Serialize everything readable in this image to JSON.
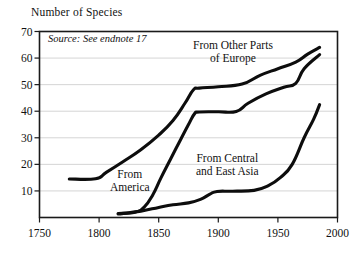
{
  "chart_data": {
    "type": "line",
    "title": "Number of Species",
    "xlabel": "",
    "ylabel": "Number of Species",
    "xlim": [
      1750,
      2000
    ],
    "ylim": [
      0,
      70
    ],
    "xticks": [
      1750,
      1800,
      1850,
      1900,
      1950,
      2000
    ],
    "yticks": [
      10,
      20,
      30,
      40,
      50,
      60,
      70
    ],
    "xtick_labels": [
      "1750",
      "1800",
      "1850",
      "1900",
      "1950",
      "2000"
    ],
    "ytick_labels": [
      "10",
      "20",
      "30",
      "40",
      "50",
      "60",
      "70"
    ],
    "grid": "horizontal",
    "legend_position": "inline-annotations",
    "annotations": [
      {
        "name": "source",
        "text": "Source: See endnote 17",
        "style": "italic"
      }
    ],
    "series": [
      {
        "name": "From America",
        "label_lines": [
          "From",
          "America"
        ],
        "points": [
          [
            1775,
            14.5
          ],
          [
            1797,
            14.6
          ],
          [
            1806,
            17.0
          ],
          [
            1820,
            21.0
          ],
          [
            1835,
            25.5
          ],
          [
            1850,
            31.0
          ],
          [
            1862,
            36.5
          ],
          [
            1872,
            43.0
          ],
          [
            1879,
            48.0
          ],
          [
            1884,
            48.7
          ],
          [
            1900,
            49.2
          ],
          [
            1920,
            50.2
          ],
          [
            1935,
            53.5
          ],
          [
            1950,
            56.0
          ],
          [
            1965,
            58.5
          ],
          [
            1975,
            61.5
          ],
          [
            1985,
            64.0
          ]
        ]
      },
      {
        "name": "From Other Parts of Europe",
        "label_lines": [
          "From Other Parts",
          "of Europe"
        ],
        "points": [
          [
            1816,
            1.5
          ],
          [
            1830,
            2.0
          ],
          [
            1838,
            4.0
          ],
          [
            1845,
            8.5
          ],
          [
            1852,
            15.0
          ],
          [
            1860,
            22.0
          ],
          [
            1868,
            29.0
          ],
          [
            1875,
            35.0
          ],
          [
            1880,
            39.0
          ],
          [
            1884,
            39.7
          ],
          [
            1900,
            39.8
          ],
          [
            1915,
            39.9
          ],
          [
            1925,
            43.0
          ],
          [
            1940,
            46.5
          ],
          [
            1955,
            49.0
          ],
          [
            1965,
            50.5
          ],
          [
            1972,
            56.0
          ],
          [
            1985,
            61.3
          ]
        ]
      },
      {
        "name": "From Central and East Asia",
        "label_lines": [
          "From Central",
          "and East Asia"
        ],
        "points": [
          [
            1816,
            1.3
          ],
          [
            1835,
            2.4
          ],
          [
            1850,
            3.8
          ],
          [
            1862,
            4.8
          ],
          [
            1875,
            5.5
          ],
          [
            1885,
            6.8
          ],
          [
            1893,
            8.8
          ],
          [
            1899,
            9.8
          ],
          [
            1912,
            9.9
          ],
          [
            1930,
            10.2
          ],
          [
            1942,
            12.0
          ],
          [
            1952,
            15.0
          ],
          [
            1962,
            20.0
          ],
          [
            1972,
            30.0
          ],
          [
            1980,
            37.0
          ],
          [
            1985,
            42.5
          ]
        ]
      }
    ],
    "colors": {
      "line": "#0d0d0d",
      "grid": "#c9c9c9",
      "frame": "#1a1a1a",
      "background": "#ffffff",
      "text": "#111111"
    }
  }
}
